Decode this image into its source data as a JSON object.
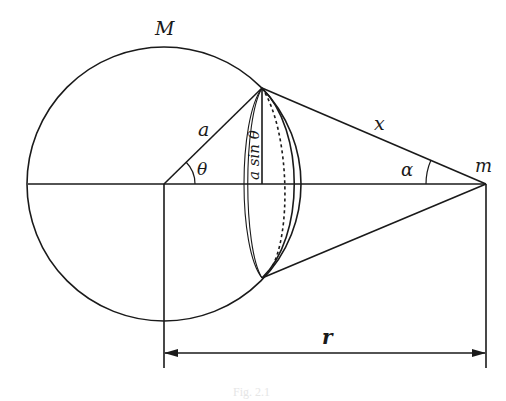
{
  "diagram": {
    "labels": {
      "mass_M": "M",
      "radius_a": "a",
      "angle_theta": "θ",
      "ring_radius": "a sin θ",
      "distance_x": "x",
      "angle_alpha": "α",
      "mass_m": "m",
      "distance_r": "r"
    },
    "caption": "Fig. 2.1",
    "colors": {
      "stroke": "#1a1a1a",
      "background": "#ffffff"
    },
    "elements": [
      "sphere of mass M, radius a",
      "thin ring slice at polar angle θ with radius a sin θ",
      "lines from ring edge to point mass m (length x, angle α)",
      "dimension arrow r from sphere center to m"
    ]
  }
}
